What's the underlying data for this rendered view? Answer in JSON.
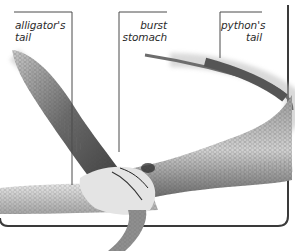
{
  "image": {
    "description": "Photograph of a python that burst after swallowing an alligator, with annotated callout labels",
    "labels": [
      {
        "id": "alligator-tail",
        "line1": "alligator's",
        "line2": "tail"
      },
      {
        "id": "burst-stomach",
        "line1": "burst",
        "line2": "stomach"
      },
      {
        "id": "python-tail",
        "line1": "python's",
        "line2": "tail"
      }
    ]
  },
  "colors": {
    "background": "#ffffff",
    "leader_line": "#4a4a4a",
    "frame": "#3a3a3a",
    "snake_dark": "#3c3c3c",
    "snake_mid": "#8a8a8a",
    "snake_light": "#d8d8d8"
  }
}
